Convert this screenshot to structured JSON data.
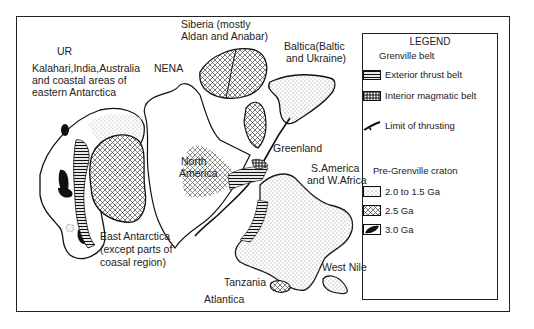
{
  "map": {
    "labels": {
      "ur": "UR",
      "ur_desc": [
        "Kalahari,India,Australia",
        "and coastal areas of",
        "eastern Antarctica"
      ],
      "nena": "NENA",
      "siberia": [
        "Siberia (mostly",
        "Aldan and Anabar)"
      ],
      "baltica": [
        "Baltica(Baltic",
        "and Ukraine)"
      ],
      "north_america": [
        "North",
        "America"
      ],
      "greenland": "Greenland",
      "s_america": [
        "S.America",
        "and W.Africa"
      ],
      "east_antarctica": [
        "East Antarctica",
        "(except parts of",
        "coasal region)"
      ],
      "tanzania": "Tanzania",
      "west_nile": "West Nile",
      "atlantica": "Atlantica"
    }
  },
  "legend": {
    "title": "LEGEND",
    "grenville_heading": "Grenville belt",
    "grenville_items": [
      {
        "pattern": "horizontal-hatch",
        "label": "Exterior thrust belt"
      },
      {
        "pattern": "grid-hatch",
        "label": "Interior magmatic belt"
      },
      {
        "pattern": "thrust-line",
        "label": "Limit of thrusting"
      }
    ],
    "craton_heading": "Pre-Grenville craton",
    "craton_items": [
      {
        "pattern": "stipple",
        "label": "2.0 to 1.5 Ga"
      },
      {
        "pattern": "crosshatch",
        "label": "2.5 Ga"
      },
      {
        "pattern": "solid-black",
        "label": "3.0 Ga"
      }
    ]
  }
}
